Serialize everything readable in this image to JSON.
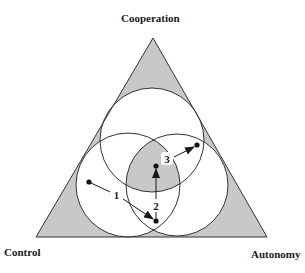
{
  "figure": {
    "type": "triangle-venn-diagram",
    "vertices": {
      "top": {
        "label": "Cooperation"
      },
      "bottom_left": {
        "label": "Control"
      },
      "bottom_right": {
        "label": "Autonomy"
      }
    },
    "colors": {
      "shaded": "#c8c8c8",
      "stroke": "#333333",
      "background": "#ffffff"
    },
    "circles": [
      {
        "name": "top",
        "cx": 152,
        "cy": 140,
        "r": 52
      },
      {
        "name": "bottom-left",
        "cx": 128,
        "cy": 185,
        "r": 52
      },
      {
        "name": "bottom-right",
        "cx": 177,
        "cy": 185,
        "r": 51
      }
    ],
    "points": [
      {
        "name": "start",
        "x": 89,
        "y": 182
      },
      {
        "name": "bottom-intersection",
        "x": 156,
        "y": 221
      },
      {
        "name": "center",
        "x": 156,
        "y": 166
      },
      {
        "name": "end",
        "x": 197,
        "y": 145
      }
    ],
    "arrows": [
      {
        "label": "1",
        "from": "start",
        "to": "bottom-intersection"
      },
      {
        "label": "2",
        "from": "bottom-intersection",
        "to": "center"
      },
      {
        "label": "3",
        "from": "center",
        "to": "end"
      }
    ]
  }
}
